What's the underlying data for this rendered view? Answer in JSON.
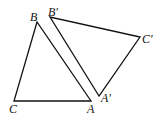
{
  "diagram": {
    "triangles": [
      {
        "name": "ABC",
        "vertices": {
          "A": [
            91,
            101
          ],
          "B": [
            37,
            22
          ],
          "C": [
            14,
            101
          ]
        }
      },
      {
        "name": "A'B'C'",
        "vertices": {
          "A'": [
            99,
            96
          ],
          "B'": [
            50,
            17
          ],
          "C'": [
            140,
            37
          ]
        }
      }
    ],
    "labels": {
      "A": "A",
      "B": "B",
      "C": "C",
      "A_prime": "A′",
      "B_prime": "B′",
      "C_prime": "C′"
    },
    "stroke_color": "#111111"
  }
}
